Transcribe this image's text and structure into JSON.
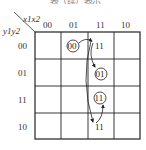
{
  "title": "表（续）表示",
  "kmap": {
    "corner": {
      "col_vars": "x1x2",
      "row_vars": "y1y2"
    },
    "col_headers": [
      "00",
      "01",
      "11",
      "10"
    ],
    "row_headers": [
      "00",
      "01",
      "11",
      "10"
    ],
    "cells": [
      {
        "row": "00",
        "col": "01",
        "value": "00",
        "circled": true
      },
      {
        "row": "00",
        "col": "11",
        "value": "11",
        "circled": false
      },
      {
        "row": "01",
        "col": "11",
        "value": "01",
        "circled": true
      },
      {
        "row": "11",
        "col": "11",
        "value": "11",
        "circled": true
      },
      {
        "row": "10",
        "col": "11",
        "value": "11",
        "circled": false
      }
    ],
    "transitions": [
      {
        "from": "r00c01",
        "to": "r00c11"
      },
      {
        "from": "r00c11",
        "to": "r01c11"
      },
      {
        "from": "r00c11",
        "to": "r10c11"
      },
      {
        "from": "r10c11",
        "to": "r11c11"
      }
    ]
  }
}
